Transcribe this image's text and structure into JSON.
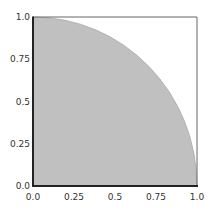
{
  "chart_data": {
    "type": "area",
    "title": "",
    "xlabel": "",
    "ylabel": "",
    "xlim": [
      0.0,
      1.0
    ],
    "ylim": [
      0.0,
      1.0
    ],
    "grid": false,
    "legend": null,
    "x_ticks": [
      "0.0",
      "0.25",
      "0.5",
      "0.75",
      "1.0"
    ],
    "y_ticks": [
      "0.0",
      "0.25",
      "0.5",
      "0.75",
      "1.0"
    ],
    "x_tick_values": [
      0.0,
      0.25,
      0.5,
      0.75,
      1.0
    ],
    "y_tick_values": [
      0.0,
      0.25,
      0.5,
      0.75,
      1.0
    ],
    "series": [
      {
        "name": "quarter circle y = sqrt(1 - x^2)",
        "x": [
          0.0,
          0.1,
          0.2,
          0.3,
          0.4,
          0.5,
          0.6,
          0.7,
          0.8,
          0.9,
          0.95,
          1.0
        ],
        "y": [
          1.0,
          0.995,
          0.98,
          0.954,
          0.917,
          0.866,
          0.8,
          0.714,
          0.6,
          0.436,
          0.312,
          0.0
        ],
        "fill": "#c0c0c0",
        "edge": "#a8a8a8"
      }
    ],
    "colors": {
      "fill": "#c0c0c0",
      "edge": "#a8a8a8",
      "spine_dark": "#222222",
      "spine_light": "#666666"
    }
  }
}
